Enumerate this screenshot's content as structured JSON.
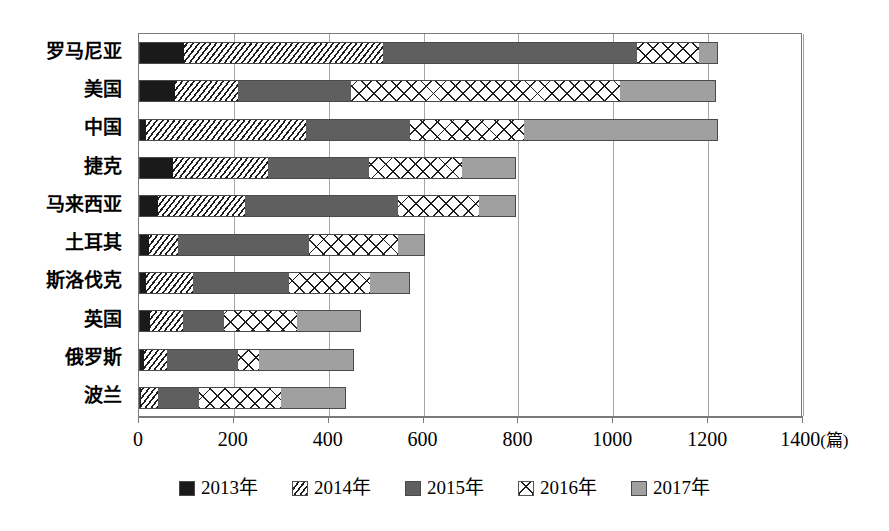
{
  "chart_data": {
    "type": "bar",
    "orientation": "horizontal",
    "stacked": true,
    "title": "",
    "xlabel": "(篇)",
    "ylabel": "",
    "xlim": [
      0,
      1400
    ],
    "xticks": [
      0,
      200,
      400,
      600,
      800,
      1000,
      1200,
      1400
    ],
    "xtick_labels": [
      "0",
      "200",
      "400",
      "600",
      "800",
      "1000",
      "1200",
      "1400"
    ],
    "unit_label": "(篇)",
    "grid": true,
    "grid_axis": "x",
    "legend_position": "bottom",
    "categories": [
      "罗马尼亚",
      "美国",
      "中国",
      "捷克",
      "马来西亚",
      "土耳其",
      "斯洛伐克",
      "英国",
      "俄罗斯",
      "波兰"
    ],
    "series": [
      {
        "name": "2013年",
        "pattern": "solid-black",
        "color": "#1a1a1a",
        "values": [
          95,
          76,
          15,
          72,
          40,
          22,
          15,
          24,
          11,
          5
        ]
      },
      {
        "name": "2014年",
        "pattern": "diagonal-hatch",
        "color": "#ffffff",
        "values": [
          420,
          133,
          337,
          200,
          184,
          60,
          99,
          68,
          49,
          35
        ]
      },
      {
        "name": "2015年",
        "pattern": "solid-dark-gray",
        "color": "#5f5f5f",
        "values": [
          535,
          238,
          220,
          212,
          322,
          277,
          203,
          87,
          149,
          87
        ]
      },
      {
        "name": "2016年",
        "pattern": "diamond-hatch",
        "color": "#ffffff",
        "values": [
          130,
          568,
          240,
          196,
          171,
          187,
          171,
          155,
          44,
          173
        ]
      },
      {
        "name": "2017年",
        "pattern": "solid-light-gray",
        "color": "#a0a0a0",
        "values": [
          40,
          202,
          408,
          115,
          78,
          56,
          84,
          135,
          200,
          137
        ]
      }
    ],
    "totals": [
      1220,
      1217,
      1220,
      795,
      795,
      602,
      572,
      469,
      453,
      437
    ]
  },
  "legend": {
    "items": [
      {
        "label": "2013年",
        "swatch": "legend-swatch-2013"
      },
      {
        "label": "2014年",
        "swatch": "legend-swatch-2014"
      },
      {
        "label": "2015年",
        "swatch": "legend-swatch-2015"
      },
      {
        "label": "2016年",
        "swatch": "legend-swatch-2016"
      },
      {
        "label": "2017年",
        "swatch": "legend-swatch-2017"
      }
    ]
  }
}
